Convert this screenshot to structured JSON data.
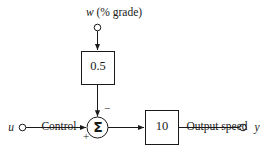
{
  "diagram": {
    "type": "control-block-diagram",
    "background_color": "#ffffff",
    "line_color": "#1a1a1a",
    "nodes": {
      "disturbance_input": {
        "label": "w (% grade)",
        "variable": "w",
        "units": "% grade",
        "terminal": "open-circle"
      },
      "disturbance_gain_block": {
        "value": "0.5",
        "shape": "rectangle"
      },
      "control_input": {
        "terminal_label": "u",
        "label_line1": "Control",
        "label_line2": "(°)",
        "units": "°",
        "terminal": "open-circle"
      },
      "summing_junction": {
        "symbol": "Σ",
        "shape": "circle",
        "sign_top": "−",
        "sign_bottom_left": "+"
      },
      "plant_block": {
        "value": "10",
        "shape": "rectangle"
      },
      "output": {
        "terminal_label": "y",
        "label_line1": "Output speed",
        "label_line2": "(mph)",
        "units": "mph",
        "terminal": "open-circle"
      }
    },
    "edges": [
      {
        "from": "disturbance_input",
        "to": "disturbance_gain_block",
        "arrow": true
      },
      {
        "from": "disturbance_gain_block",
        "to": "summing_junction",
        "arrow": true
      },
      {
        "from": "control_input",
        "to": "summing_junction",
        "arrow": true
      },
      {
        "from": "summing_junction",
        "to": "plant_block",
        "arrow": true
      },
      {
        "from": "plant_block",
        "to": "output",
        "arrow": false
      }
    ]
  }
}
